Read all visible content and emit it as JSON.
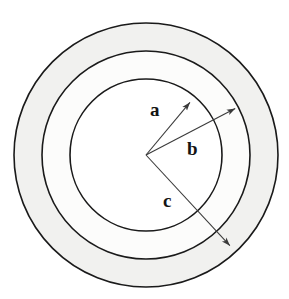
{
  "figure": {
    "type": "geometry-diagram",
    "background_color": "#ffffff",
    "stroke_color": "#1a1a1a",
    "arrow_color": "#3a3a3a",
    "center": {
      "x": 146,
      "y": 155
    },
    "circles": [
      {
        "name": "inner-circle",
        "radius": 76,
        "fill": "#ffffff",
        "stroke": "#1a1a1a",
        "stroke_width": 1.6
      },
      {
        "name": "middle-circle",
        "radius": 104,
        "fill": "#fcfcfb",
        "stroke": "#1a1a1a",
        "stroke_width": 1.6
      },
      {
        "name": "outer-circle",
        "radius": 132,
        "fill": "#f1f1ef",
        "stroke": "#1a1a1a",
        "stroke_width": 1.6
      }
    ],
    "rings": [
      {
        "name": "outer-ring",
        "inner_radius": 104,
        "outer_radius": 132,
        "fill": "#f1f1ef"
      },
      {
        "name": "middle-ring",
        "inner_radius": 76,
        "outer_radius": 104,
        "fill": "#fcfcfb"
      }
    ],
    "arrows": [
      {
        "label": "a",
        "name": "radius-arrow-a",
        "from": {
          "x": 146,
          "y": 155
        },
        "to": {
          "x": 192,
          "y": 100
        },
        "target_circle": "inner-circle",
        "label_position": {
          "x": 150,
          "y": 100
        }
      },
      {
        "label": "b",
        "name": "radius-arrow-b",
        "from": {
          "x": 146,
          "y": 155
        },
        "to": {
          "x": 238,
          "y": 107
        },
        "target_circle": "middle-circle",
        "label_position": {
          "x": 187,
          "y": 139
        }
      },
      {
        "label": "c",
        "name": "radius-arrow-c",
        "from": {
          "x": 146,
          "y": 155
        },
        "to": {
          "x": 232,
          "y": 248
        },
        "target_circle": "outer-circle",
        "label_position": {
          "x": 163,
          "y": 191
        }
      }
    ],
    "labels": {
      "a": "a",
      "b": "b",
      "c": "c"
    }
  }
}
